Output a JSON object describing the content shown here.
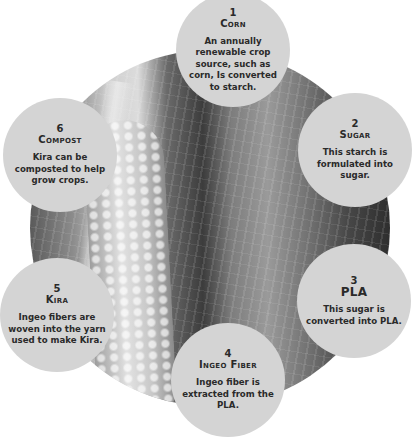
{
  "diagram": {
    "type": "cycle",
    "center_image": "corn-and-fabric-photo",
    "colors": {
      "circle_fill": "#d4d4d4",
      "text": "#2a2a2a",
      "background": "#ffffff"
    },
    "steps": [
      {
        "number": "1",
        "title": "Corn",
        "description": "An annually renewable crop source, such as corn, Is converted to starch."
      },
      {
        "number": "2",
        "title": "Sugar",
        "description": "This starch is formulated into sugar."
      },
      {
        "number": "3",
        "title": "PLA",
        "description": "This sugar is converted into PLA."
      },
      {
        "number": "4",
        "title": "Ingeo Fiber",
        "description": "Ingeo fiber is extracted from the PLA."
      },
      {
        "number": "5",
        "title": "Kira",
        "description": "Ingeo fibers are woven into the yarn used to make Kira."
      },
      {
        "number": "6",
        "title": "Compost",
        "description": "Kira can be composted to help grow crops."
      }
    ]
  }
}
